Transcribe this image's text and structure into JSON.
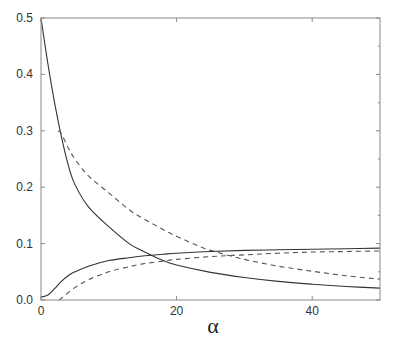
{
  "chart_data": {
    "type": "line",
    "title": "",
    "xlabel": "α",
    "ylabel": "",
    "xlim": [
      0,
      50
    ],
    "ylim": [
      0.0,
      0.5
    ],
    "x_ticks": [
      0,
      20,
      40
    ],
    "x_tick_labels": [
      "0",
      "20",
      "40"
    ],
    "y_ticks": [
      0.0,
      0.1,
      0.2,
      0.3,
      0.4,
      0.5
    ],
    "y_tick_labels": [
      "0.0",
      "0.1",
      "0.2",
      "0.3",
      "0.4",
      "0.5"
    ],
    "grid": false,
    "legend": null,
    "series": [
      {
        "name": "solid-decreasing",
        "style": "solid",
        "color": "#333333",
        "x": [
          0,
          1,
          2,
          3,
          4,
          5,
          7,
          10,
          13,
          15,
          18,
          20,
          25,
          30,
          35,
          40,
          45,
          50
        ],
        "y": [
          0.5,
          0.42,
          0.35,
          0.29,
          0.24,
          0.205,
          0.165,
          0.13,
          0.1,
          0.087,
          0.07,
          0.062,
          0.049,
          0.04,
          0.033,
          0.028,
          0.024,
          0.021
        ]
      },
      {
        "name": "dashed-decreasing",
        "style": "dashed",
        "color": "#444444",
        "x": [
          2.5,
          3,
          4,
          5,
          7,
          10,
          13,
          15,
          18,
          20,
          23,
          25,
          30,
          35,
          40,
          45,
          50
        ],
        "y": [
          0.3,
          0.295,
          0.27,
          0.25,
          0.22,
          0.19,
          0.16,
          0.145,
          0.125,
          0.113,
          0.097,
          0.088,
          0.072,
          0.06,
          0.051,
          0.043,
          0.037
        ]
      },
      {
        "name": "solid-increasing",
        "style": "solid",
        "color": "#333333",
        "x": [
          0,
          1,
          2,
          3,
          4,
          5,
          7,
          10,
          13,
          15,
          18,
          20,
          25,
          30,
          35,
          40,
          45,
          50
        ],
        "y": [
          0.005,
          0.009,
          0.02,
          0.033,
          0.043,
          0.05,
          0.06,
          0.07,
          0.075,
          0.078,
          0.081,
          0.083,
          0.086,
          0.088,
          0.089,
          0.09,
          0.091,
          0.092
        ]
      },
      {
        "name": "dashed-increasing",
        "style": "dashed",
        "color": "#444444",
        "x": [
          2.7,
          3.5,
          5,
          7,
          10,
          13,
          15,
          18,
          20,
          25,
          30,
          35,
          40,
          45,
          50
        ],
        "y": [
          0.0,
          0.008,
          0.022,
          0.036,
          0.05,
          0.059,
          0.064,
          0.069,
          0.072,
          0.077,
          0.08,
          0.083,
          0.085,
          0.086,
          0.087
        ]
      }
    ]
  },
  "plot_area": {
    "left": 41,
    "top": 18,
    "right": 380,
    "bottom": 300
  },
  "colors": {
    "axis": "#888888",
    "solid": "#333333",
    "dashed": "#555555",
    "background": "#ffffff"
  }
}
